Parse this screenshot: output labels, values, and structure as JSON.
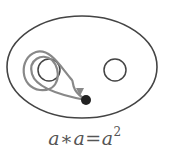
{
  "figure": {
    "caption": {
      "lhs_var1": "a",
      "operator": "∗",
      "lhs_var2": "a",
      "equals": "=",
      "rhs_base": "a",
      "rhs_exponent": "2"
    },
    "elements": {
      "outer_surface": "ellipse",
      "hole_left": "circle",
      "hole_right": "circle",
      "loop_path": "double loop winding twice around left hole",
      "base_point": "filled dot"
    },
    "colors": {
      "outline": "#444444",
      "loop": "#888888",
      "point": "#222222",
      "text": "#555555"
    }
  }
}
